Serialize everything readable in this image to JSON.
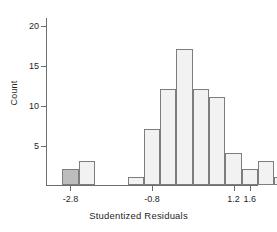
{
  "chart_data": {
    "type": "bar",
    "title": "",
    "xlabel": "Studentized Residuals",
    "ylabel": "Count",
    "grid": false,
    "legend": "none",
    "bin_width": 0.4,
    "xlim": [
      -3.4,
      1.8
    ],
    "ylim": [
      0,
      21
    ],
    "xticks": [
      -2.8,
      -0.8,
      1.2,
      1.6
    ],
    "xtick_labels": [
      "-2.8",
      "-0.8",
      "1.2",
      "1.6"
    ],
    "yticks": [
      5,
      10,
      15,
      20
    ],
    "ytick_labels": [
      "5",
      "10",
      "15",
      "20"
    ],
    "bins": [
      {
        "x0": -3.0,
        "x1": -2.6,
        "count": 2,
        "highlight": true
      },
      {
        "x0": -2.6,
        "x1": -2.2,
        "count": 3,
        "highlight": false
      },
      {
        "x0": -2.2,
        "x1": -1.8,
        "count": 0,
        "highlight": false
      },
      {
        "x0": -1.8,
        "x1": -1.4,
        "count": 0,
        "highlight": false
      },
      {
        "x0": -1.4,
        "x1": -1.0,
        "count": 1,
        "highlight": false
      },
      {
        "x0": -1.0,
        "x1": -0.6,
        "count": 7,
        "highlight": false
      },
      {
        "x0": -0.6,
        "x1": -0.2,
        "count": 12,
        "highlight": false
      },
      {
        "x0": -0.2,
        "x1": 0.2,
        "count": 17,
        "highlight": false
      },
      {
        "x0": 0.2,
        "x1": 0.6,
        "count": 12,
        "highlight": false
      },
      {
        "x0": 0.6,
        "x1": 1.0,
        "count": 11,
        "highlight": false
      },
      {
        "x0": 1.0,
        "x1": 1.4,
        "count": 4,
        "highlight": false
      },
      {
        "x0": 1.4,
        "x1": 1.8,
        "count": 2,
        "highlight": false
      },
      {
        "x0": 1.8,
        "x1": 2.2,
        "count": 3,
        "highlight": false
      },
      {
        "x0": 2.2,
        "x1": 2.6,
        "count": 1,
        "highlight": false
      },
      {
        "x0": 2.6,
        "x1": 3.0,
        "count": 2,
        "highlight": false
      }
    ],
    "categories": [
      "-3.0",
      "-2.6",
      "-2.2",
      "-1.8",
      "-1.4",
      "-1.0",
      "-0.6",
      "-0.2",
      "0.2",
      "0.6",
      "1.0",
      "1.4",
      "1.8",
      "2.2",
      "2.6"
    ],
    "values": [
      2,
      3,
      0,
      0,
      1,
      7,
      12,
      17,
      12,
      11,
      4,
      2,
      3,
      1,
      2
    ],
    "highlight_color": "#bdbdbd",
    "bar_color": "#f2f2f2",
    "bar_edge_color": "#7d7d7d"
  }
}
